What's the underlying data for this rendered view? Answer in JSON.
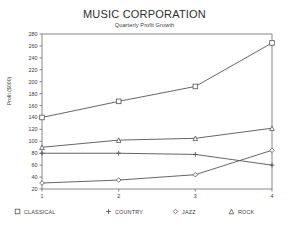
{
  "chart_data": {
    "type": "line",
    "title": "MUSIC CORPORATION",
    "subtitle": "Quarterly Profit Growth",
    "xlabel": "",
    "ylabel": "Profit ($000)",
    "x": [
      1,
      2,
      3,
      4
    ],
    "xticklabels": [
      "1",
      "2",
      "3",
      "4"
    ],
    "yticklabels": [
      "20",
      "40",
      "60",
      "80",
      "100",
      "120",
      "140",
      "160",
      "180",
      "200",
      "220",
      "240",
      "260",
      "280"
    ],
    "ylim": [
      20,
      280
    ],
    "xlim": [
      1,
      4
    ],
    "grid": false,
    "legend_position": "bottom",
    "series": [
      {
        "name": "CLASSICAL",
        "marker": "square",
        "values": [
          140,
          167,
          192,
          265
        ]
      },
      {
        "name": "COUNTRY",
        "marker": "plus",
        "values": [
          80,
          80,
          78,
          60
        ]
      },
      {
        "name": "JAZZ",
        "marker": "diamond",
        "values": [
          30,
          35,
          44,
          85
        ]
      },
      {
        "name": "ROCK",
        "marker": "triangle",
        "values": [
          90,
          102,
          105,
          122
        ]
      }
    ]
  },
  "legend": {
    "items": [
      {
        "label": "CLASSICAL",
        "marker": "square"
      },
      {
        "label": "COUNTRY",
        "marker": "plus"
      },
      {
        "label": "JAZZ",
        "marker": "diamond"
      },
      {
        "label": "ROCK",
        "marker": "triangle"
      }
    ]
  },
  "colors": {
    "line": "#555555",
    "axis": "#6a6a6a",
    "text": "#3a3a3a",
    "background": "#ffffff"
  }
}
